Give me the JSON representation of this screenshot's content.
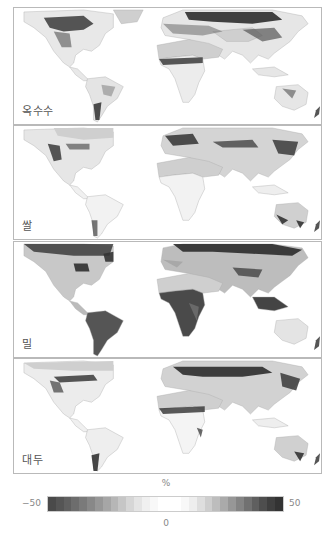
{
  "figure": {
    "type": "choropleth-world-map-panels",
    "panels": [
      {
        "id": "maize",
        "label": "옥수수",
        "top": 7,
        "height": 118
      },
      {
        "id": "rice",
        "label": "쌀",
        "top": 125,
        "height": 115
      },
      {
        "id": "wheat",
        "label": "밀",
        "top": 241,
        "height": 117
      },
      {
        "id": "soybean",
        "label": "대두",
        "top": 358,
        "height": 116
      }
    ]
  },
  "colorbar": {
    "unit": "%",
    "min_label": "−50",
    "mid_label": "0",
    "max_label": "50",
    "min": -50,
    "max": 50,
    "colors": [
      "#4a4a4a",
      "#555555",
      "#606060",
      "#6d6d6d",
      "#7a7a7a",
      "#888888",
      "#979797",
      "#a6a6a6",
      "#b6b6b6",
      "#c6c6c6",
      "#d6d6d6",
      "#e4e4e4",
      "#f0f0f0",
      "#f8f8f8",
      "#ffffff",
      "#ffffff",
      "#ffffff",
      "#f8f8f8",
      "#eeeeee",
      "#dedede",
      "#cecece",
      "#bdbdbd",
      "#aaaaaa",
      "#979797",
      "#848484",
      "#717171",
      "#5f5f5f",
      "#4e4e4e",
      "#3f3f3f",
      "#333333"
    ]
  },
  "colors": {
    "no_data_land": "#cfcfcf",
    "ocean": "#ffffff",
    "strong": "#3a3a3a",
    "medium": "#7c7c7c",
    "light": "#e6e6e6",
    "border": "#b9b9b9"
  }
}
